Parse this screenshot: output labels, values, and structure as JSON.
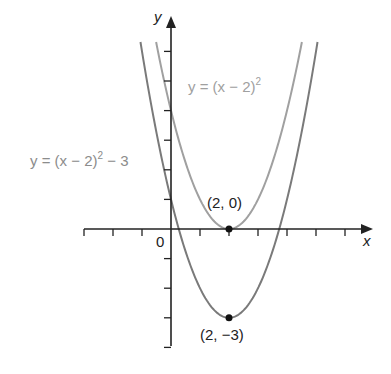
{
  "diagram": {
    "axes": {
      "x_label": "x",
      "y_label": "y",
      "origin_label": "0",
      "x_range": [
        -3,
        7
      ],
      "y_range": [
        -4,
        6
      ],
      "tick_step": 1
    },
    "curves": [
      {
        "name": "y = (x - 2)^2",
        "label_main": "y = (x − 2)",
        "label_sup": "2",
        "label_tail": "",
        "shift": 0,
        "color": "#a0a0a0"
      },
      {
        "name": "y = (x - 2)^2 - 3",
        "label_main": "y = (x − 2)",
        "label_sup": "2",
        "label_tail": " − 3",
        "shift": -3,
        "color": "#7a7a7a"
      }
    ],
    "points": [
      {
        "label": "(2, 0)",
        "x": 2,
        "y": 0
      },
      {
        "label": "(2, −3)",
        "x": 2,
        "y": -3
      }
    ]
  }
}
